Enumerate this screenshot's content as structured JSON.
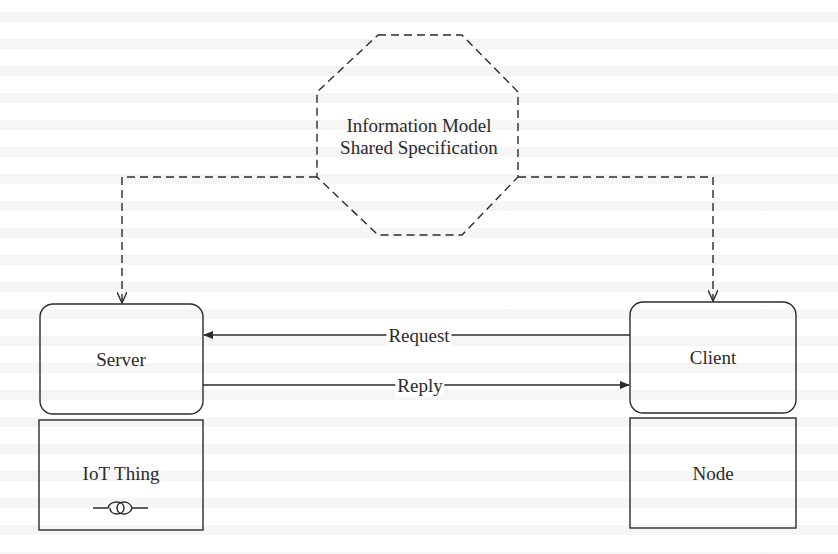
{
  "diagram": {
    "model": {
      "line1": "Information Model",
      "line2": "Shared Specification",
      "shape": "octagon",
      "border": "dashed"
    },
    "nodes": {
      "server": {
        "label": "Server"
      },
      "client": {
        "label": "Client"
      },
      "iot_thing": {
        "label": "IoT Thing",
        "icon": "sensor-symbol-icon"
      },
      "node": {
        "label": "Node"
      }
    },
    "edges": {
      "request": {
        "label": "Request",
        "from": "Client",
        "to": "Server"
      },
      "reply": {
        "label": "Reply",
        "from": "Server",
        "to": "Client"
      },
      "model_to_server": {
        "style": "dashed",
        "from": "Information Model",
        "to": "Server"
      },
      "model_to_client": {
        "style": "dashed",
        "from": "Information Model",
        "to": "Client"
      }
    },
    "colors": {
      "stroke": "#2b2b2b",
      "text": "#2b2b2b",
      "background": "#ffffff"
    }
  }
}
